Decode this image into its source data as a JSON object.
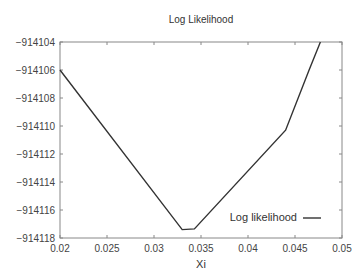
{
  "chart_data": {
    "type": "line",
    "title": "Log Likelihood",
    "xlabel": "Xi",
    "ylabel": "",
    "xlim": [
      0.02,
      0.05
    ],
    "ylim": [
      -914118,
      -914104
    ],
    "xticks": [
      0.02,
      0.025,
      0.03,
      0.035,
      0.04,
      0.045,
      0.05
    ],
    "xtick_labels": [
      "0.02",
      "0.025",
      "0.03",
      "0.035",
      "0.04",
      "0.045",
      "0.05"
    ],
    "yticks": [
      -914104,
      -914106,
      -914108,
      -914110,
      -914112,
      -914114,
      -914116,
      -914118
    ],
    "ytick_labels": [
      "−914104",
      "−914106",
      "−914108",
      "−914110",
      "−914112",
      "−914114",
      "−914116",
      "−914118"
    ],
    "grid": false,
    "legend_position": "lower right",
    "series": [
      {
        "name": "Log likelihood",
        "color": "#333333",
        "x": [
          0.02,
          0.033,
          0.0343,
          0.044,
          0.0465,
          0.0477
        ],
        "y": [
          -914106.0,
          -914117.4,
          -914117.35,
          -914110.3,
          -914106.0,
          -914104.0
        ]
      }
    ]
  }
}
